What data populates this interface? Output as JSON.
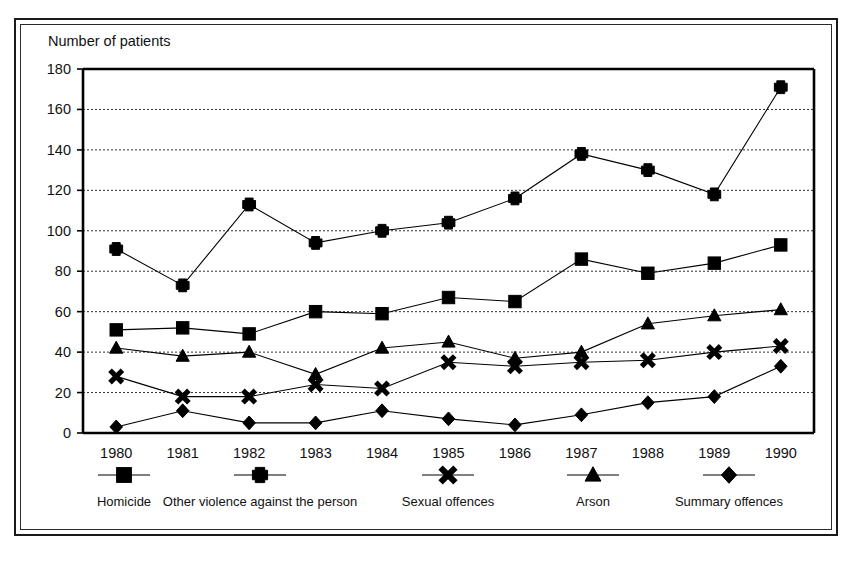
{
  "chart_data": {
    "type": "line",
    "title": "",
    "ylabel": "Number of patients",
    "xlabel": "",
    "categories": [
      "1980",
      "1981",
      "1982",
      "1983",
      "1984",
      "1985",
      "1986",
      "1987",
      "1988",
      "1989",
      "1990"
    ],
    "x": [
      1980,
      1981,
      1982,
      1983,
      1984,
      1985,
      1986,
      1987,
      1988,
      1989,
      1990
    ],
    "ylim": [
      0,
      180
    ],
    "ytick_step": 20,
    "yticks": [
      0,
      20,
      40,
      60,
      80,
      100,
      120,
      140,
      160,
      180
    ],
    "grid": true,
    "grid_style": "dotted-horizontal",
    "legend_position": "below",
    "series": [
      {
        "name": "Homicide",
        "marker": "square",
        "values": [
          51,
          52,
          49,
          60,
          59,
          67,
          65,
          86,
          79,
          84,
          93
        ]
      },
      {
        "name": "Other violence against the person",
        "marker": "plus",
        "values": [
          91,
          73,
          113,
          94,
          100,
          104,
          116,
          138,
          130,
          118,
          171
        ]
      },
      {
        "name": "Sexual offences",
        "marker": "cross",
        "values": [
          28,
          18,
          18,
          24,
          22,
          35,
          33,
          35,
          36,
          40,
          43
        ]
      },
      {
        "name": "Arson",
        "marker": "triangle",
        "values": [
          42,
          38,
          40,
          29,
          42,
          45,
          37,
          40,
          54,
          58,
          61
        ]
      },
      {
        "name": "Summary offences",
        "marker": "diamond",
        "values": [
          3,
          11,
          5,
          5,
          11,
          7,
          4,
          9,
          15,
          18,
          33
        ]
      }
    ]
  },
  "legend": {
    "entries": [
      {
        "label": "Homicide",
        "marker": "square"
      },
      {
        "label": "Other violence against the person",
        "marker": "plus"
      },
      {
        "label": "Sexual offences",
        "marker": "cross"
      },
      {
        "label": "Arson",
        "marker": "triangle"
      },
      {
        "label": "Summary offences",
        "marker": "diamond"
      }
    ]
  },
  "colors": {
    "ink": "#000000",
    "background": "#ffffff",
    "grid": "#333333"
  }
}
